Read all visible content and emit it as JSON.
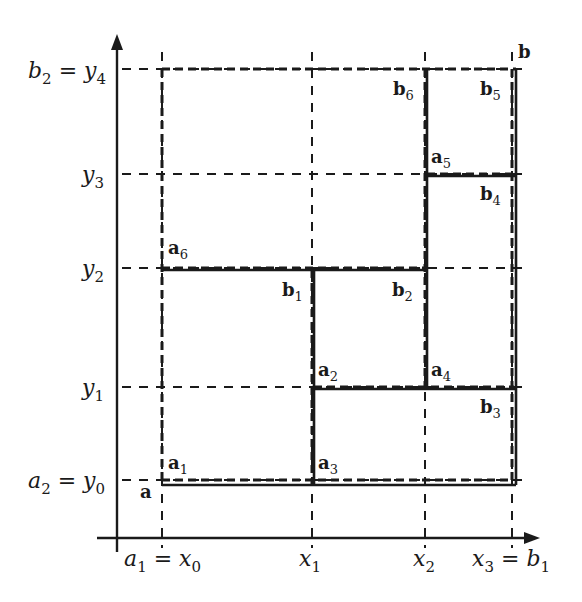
{
  "diagram": {
    "type": "rectangle-partition",
    "axes": {
      "x_ticks": [
        {
          "name": "x0",
          "label": "a",
          "sub": "1",
          "eq": " = x",
          "eqsub": "0"
        },
        {
          "name": "x1",
          "label": "x",
          "sub": "1"
        },
        {
          "name": "x2",
          "label": "x",
          "sub": "2"
        },
        {
          "name": "x3",
          "label": "x",
          "sub": "3",
          "eq": " = b",
          "eqsub": "1"
        }
      ],
      "y_ticks": [
        {
          "name": "y0",
          "label": "a",
          "sub": "2",
          "eq": " = y",
          "eqsub": "0"
        },
        {
          "name": "y1",
          "label": "y",
          "sub": "1"
        },
        {
          "name": "y2",
          "label": "y",
          "sub": "2"
        },
        {
          "name": "y3",
          "label": "y",
          "sub": "3"
        },
        {
          "name": "y4",
          "label": "b",
          "sub": "2",
          "eq": " = y",
          "eqsub": "4"
        }
      ]
    },
    "points": {
      "a": {
        "base": "a",
        "sub": ""
      },
      "b": {
        "base": "b",
        "sub": ""
      },
      "a1": {
        "base": "a",
        "sub": "1"
      },
      "a2": {
        "base": "a",
        "sub": "2"
      },
      "a3": {
        "base": "a",
        "sub": "3"
      },
      "a4": {
        "base": "a",
        "sub": "4"
      },
      "a5": {
        "base": "a",
        "sub": "5"
      },
      "a6": {
        "base": "a",
        "sub": "6"
      },
      "b1": {
        "base": "b",
        "sub": "1"
      },
      "b2": {
        "base": "b",
        "sub": "2"
      },
      "b3": {
        "base": "b",
        "sub": "3"
      },
      "b4": {
        "base": "b",
        "sub": "4"
      },
      "b5": {
        "base": "b",
        "sub": "5"
      },
      "b6": {
        "base": "b",
        "sub": "6"
      }
    },
    "rectangles": [
      {
        "from": "a1",
        "to": "b1"
      },
      {
        "from": "a2",
        "to": "b2"
      },
      {
        "from": "a3",
        "to": "b3"
      },
      {
        "from": "a4",
        "to": "b4"
      },
      {
        "from": "a5",
        "to": "b5"
      },
      {
        "from": "a6",
        "to": "b6"
      }
    ],
    "colors": {
      "ink": "#1a1a1a",
      "background": "#ffffff"
    }
  }
}
